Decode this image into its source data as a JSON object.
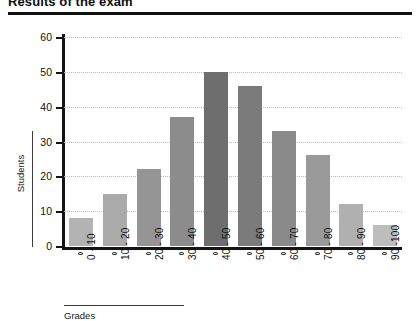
{
  "chart_data": {
    "type": "bar",
    "title": "Results of the exam",
    "xlabel": "Grades",
    "ylabel": "Students",
    "categories": [
      "0 - 10",
      "10 - 20",
      "20 - 30",
      "30 - 40",
      "40 - 50",
      "50 - 60",
      "60 - 70",
      "70 - 80",
      "80 - 90",
      "90 -100"
    ],
    "values": [
      8,
      15,
      22,
      37,
      50,
      46,
      33,
      26,
      12,
      6
    ],
    "ylim": [
      0,
      60
    ],
    "yticks": [
      0,
      10,
      20,
      30,
      40,
      50,
      60
    ],
    "ytick_labels": [
      "0",
      "10",
      "20",
      "30",
      "40",
      "50",
      "60"
    ],
    "grid": true,
    "legend": "none",
    "bar_colors": [
      "#b3b3b3",
      "#aaaaaa",
      "#959595",
      "#8c8c8c",
      "#6e6e6e",
      "#7b7b7b",
      "#8a8a8a",
      "#9a9a9a",
      "#b0b0b0",
      "#bdbdbd"
    ],
    "axis_color": "#141414",
    "grid_color": "#b9b9b9"
  }
}
